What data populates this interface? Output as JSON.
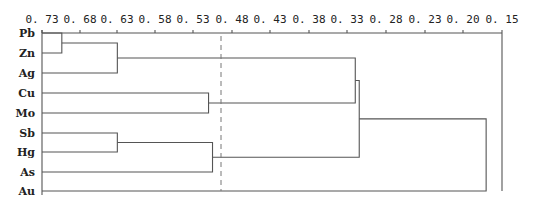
{
  "chart_data": {
    "type": "dendrogram",
    "orientation": "horizontal",
    "axis": {
      "position": "top",
      "ticks": [
        "0.73",
        "0.68",
        "0.63",
        "0.58",
        "0.53",
        "0.48",
        "0.43",
        "0.38",
        "0.33",
        "0.28",
        "0.23",
        "0.20",
        "0.15"
      ],
      "range": [
        0.73,
        0.15
      ]
    },
    "leaves": [
      "Pb",
      "Zn",
      "Ag",
      "Cu",
      "Mo",
      "Sb",
      "Hg",
      "As",
      "Au"
    ],
    "merges": [
      {
        "a": "Pb",
        "b": "Zn",
        "height": 0.705
      },
      {
        "a": "Pb-Zn",
        "b": "Ag",
        "height": 0.635
      },
      {
        "a": "Cu",
        "b": "Mo",
        "height": 0.52
      },
      {
        "a": "Sb",
        "b": "Hg",
        "height": 0.635
      },
      {
        "a": "Sb-Hg",
        "b": "As",
        "height": 0.515
      },
      {
        "a": "Pb-Zn-Ag",
        "b": "Cu-Mo",
        "height": 0.335
      },
      {
        "a": "Pb-Zn-Ag-Cu-Mo",
        "b": "Sb-Hg-As",
        "height": 0.33
      },
      {
        "a": "all-others",
        "b": "Au",
        "height": 0.17
      }
    ],
    "cut_line": {
      "value": 0.495,
      "style": "dashed"
    }
  },
  "layout": {
    "axis_y": 33,
    "x_left": 42,
    "x_right": 502,
    "tick_x": [
      42,
      80,
      117,
      155,
      193,
      232,
      270,
      309,
      347,
      386,
      425,
      463,
      502
    ],
    "leaf_y": [
      33,
      53,
      73,
      93,
      113,
      133,
      152,
      172,
      191
    ],
    "cut_x": 221
  }
}
